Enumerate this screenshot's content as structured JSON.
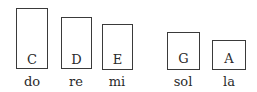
{
  "diagram": {
    "notes": [
      {
        "letter": "C",
        "syllable": "do"
      },
      {
        "letter": "D",
        "syllable": "re"
      },
      {
        "letter": "E",
        "syllable": "mi"
      },
      {
        "letter": "G",
        "syllable": "sol"
      },
      {
        "letter": "A",
        "syllable": "la"
      }
    ]
  }
}
